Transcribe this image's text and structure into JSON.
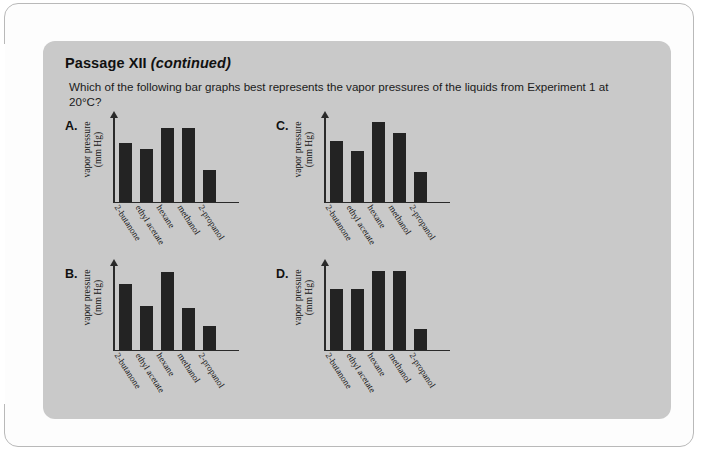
{
  "panel": {
    "title_main": "Passage XII",
    "title_paren": "(continued)",
    "question": "Which of the following bar graphs best represents the vapor pressures of the liquids from Experiment 1 at 20°C?"
  },
  "axis": {
    "ylabel_line1": "vapor pressure",
    "ylabel_line2": "(mm Hg)",
    "categories": [
      "2-butanone",
      "ethyl acetate",
      "hexane",
      "methanol",
      "2-propanol"
    ]
  },
  "options": [
    {
      "letter": "A."
    },
    {
      "letter": "B."
    },
    {
      "letter": "C."
    },
    {
      "letter": "D."
    }
  ],
  "chart_data": [
    {
      "type": "bar",
      "title": "A.",
      "categories": [
        "2-butanone",
        "ethyl acetate",
        "hexane",
        "methanol",
        "2-propanol"
      ],
      "values": [
        70,
        62,
        88,
        88,
        38
      ],
      "xlabel": "",
      "ylabel": "vapor pressure (mm Hg)",
      "ylim": [
        0,
        100
      ],
      "grid": false,
      "legend": "none"
    },
    {
      "type": "bar",
      "title": "B.",
      "categories": [
        "2-butanone",
        "ethyl acetate",
        "hexane",
        "methanol",
        "2-propanol"
      ],
      "values": [
        78,
        52,
        92,
        50,
        28
      ],
      "xlabel": "",
      "ylabel": "vapor pressure (mm Hg)",
      "ylim": [
        0,
        100
      ],
      "grid": false,
      "legend": "none"
    },
    {
      "type": "bar",
      "title": "C.",
      "categories": [
        "2-butanone",
        "ethyl acetate",
        "hexane",
        "methanol",
        "2-propanol"
      ],
      "values": [
        72,
        60,
        95,
        82,
        35
      ],
      "xlabel": "",
      "ylabel": "vapor pressure (mm Hg)",
      "ylim": [
        0,
        100
      ],
      "grid": false,
      "legend": "none"
    },
    {
      "type": "bar",
      "title": "D.",
      "categories": [
        "2-butanone",
        "ethyl acetate",
        "hexane",
        "methanol",
        "2-propanol"
      ],
      "values": [
        72,
        72,
        93,
        93,
        25
      ],
      "xlabel": "",
      "ylabel": "vapor pressure (mm Hg)",
      "ylim": [
        0,
        100
      ],
      "grid": false,
      "legend": "none"
    }
  ],
  "colors": {
    "page_background": "#fdfdfd",
    "panel_background": "#c9c9c9",
    "bar_fill": "#232323",
    "axis": "#2a2a2a",
    "text": "#1a1a1a"
  }
}
